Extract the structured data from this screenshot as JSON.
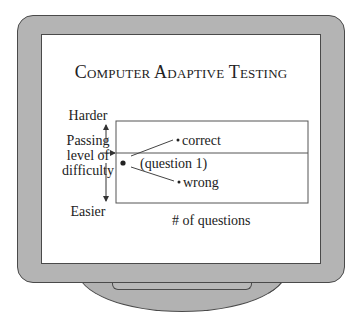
{
  "title": "Computer Adaptive Testing",
  "y_axis": {
    "top_label": "Harder",
    "middle_label_lines": [
      "Passing",
      "level of",
      "difficulty"
    ],
    "bottom_label": "Easier"
  },
  "x_axis": {
    "label": "# of questions"
  },
  "chart": {
    "start_point_label": "(question 1)",
    "branch_up_label": "correct",
    "branch_down_label": "wrong"
  },
  "colors": {
    "bezel": "#b4b4b4",
    "outline": "#4a4a4a",
    "screen": "#ffffff",
    "text": "#222222"
  }
}
